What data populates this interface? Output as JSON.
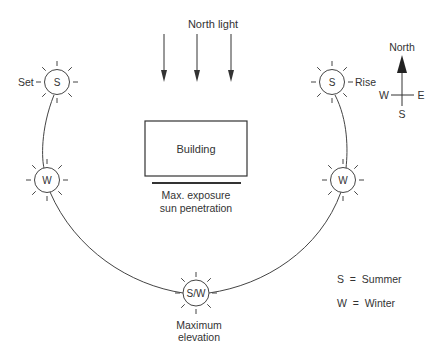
{
  "north_light": {
    "label": "North light"
  },
  "building": {
    "label": "Building"
  },
  "exposure": {
    "line1": "Max. exposure",
    "line2": "sun penetration"
  },
  "suns": {
    "set": {
      "symbol": "S",
      "label": "Set"
    },
    "rise": {
      "symbol": "S",
      "label": "Rise"
    },
    "west_winter": {
      "symbol": "W"
    },
    "east_winter": {
      "symbol": "W"
    },
    "max": {
      "symbol": "S/W",
      "line1": "Maximum",
      "line2": "elevation"
    }
  },
  "compass": {
    "north": "North",
    "west": "W",
    "east": "E",
    "south": "S"
  },
  "legend": {
    "summer": "S  =  Summer",
    "winter": "W  =  Winter"
  }
}
